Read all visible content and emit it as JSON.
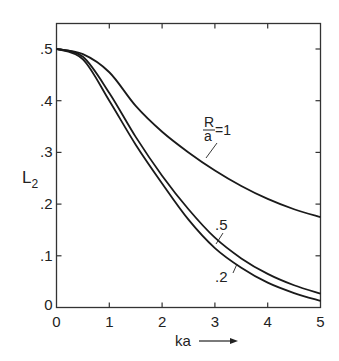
{
  "chart_data": {
    "type": "line",
    "title": "",
    "xlabel": "ka",
    "ylabel": "L2",
    "xlim": [
      0,
      5
    ],
    "ylim": [
      0,
      0.5
    ],
    "grid": false,
    "legend": "inline annotations",
    "x_ticks": [
      "0",
      "1",
      "2",
      "3",
      "4",
      "5"
    ],
    "y_ticks": [
      ".1",
      ".2",
      ".3",
      ".4",
      ".5"
    ],
    "y_zero_label": "0",
    "x": [
      0,
      0.5,
      1,
      1.5,
      2,
      2.5,
      3,
      3.5,
      4,
      4.5,
      5
    ],
    "series": [
      {
        "name": "R/a = 1",
        "label_display": "R/a=1",
        "values": [
          0.5,
          0.49,
          0.455,
          0.39,
          0.34,
          0.3,
          0.265,
          0.235,
          0.21,
          0.19,
          0.175
        ]
      },
      {
        "name": "R/a = .5",
        "label_display": ".5",
        "values": [
          0.5,
          0.485,
          0.415,
          0.33,
          0.255,
          0.19,
          0.135,
          0.095,
          0.065,
          0.043,
          0.027
        ]
      },
      {
        "name": "R/a = .2",
        "label_display": ".2",
        "values": [
          0.5,
          0.48,
          0.4,
          0.315,
          0.24,
          0.17,
          0.115,
          0.077,
          0.048,
          0.028,
          0.013
        ]
      }
    ],
    "annotations": [
      {
        "text": "R/a = 1",
        "series": 0
      },
      {
        "text": ".5",
        "series": 1
      },
      {
        "text": ".2",
        "series": 2
      }
    ]
  },
  "labels": {
    "ylabel_main": "L",
    "ylabel_sub": "2",
    "xlabel": "ka",
    "ann_R": "R",
    "ann_a": "a",
    "ann_eq": "=1",
    "ann_5": ".5",
    "ann_2": ".2"
  },
  "colors": {
    "line": "#1a1a1a",
    "axis": "#333333",
    "background": "#ffffff"
  }
}
